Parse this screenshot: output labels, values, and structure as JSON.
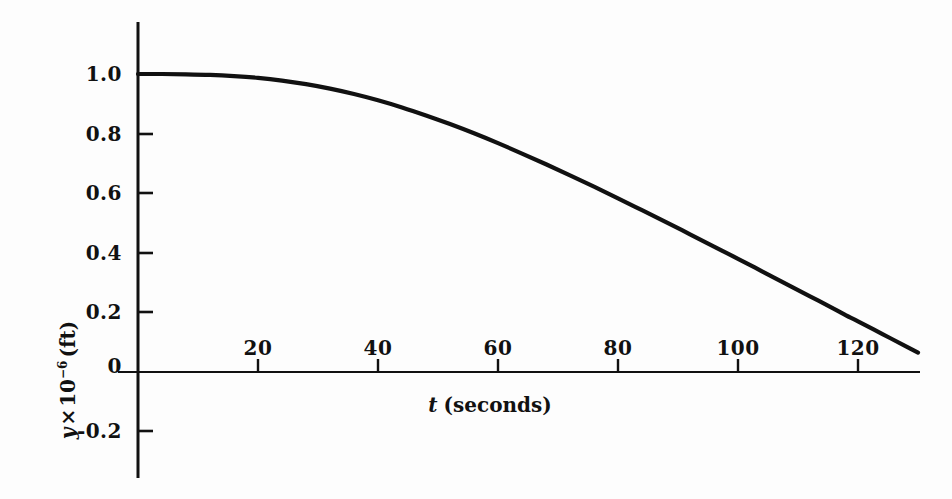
{
  "figure": {
    "background_color": "#fdfdfd",
    "ink_color": "#111111"
  },
  "chart_data": {
    "type": "line",
    "title": "",
    "subtitle": "",
    "xlabel_var": "t",
    "xlabel_unit": "(seconds)",
    "ylabel_var": "y",
    "ylabel_times": "×",
    "ylabel_base": "10",
    "ylabel_exponent": "−6",
    "ylabel_unit": "(ft)",
    "xlim": [
      0,
      132
    ],
    "ylim": [
      -0.3,
      1.12
    ],
    "grid": false,
    "legend": "none",
    "xticks": [
      20,
      40,
      60,
      80,
      100,
      120
    ],
    "xtick_labels": [
      "20",
      "40",
      "60",
      "80",
      "100",
      "120"
    ],
    "yticks": [
      1.0,
      0.8,
      0.6,
      0.4,
      0.2,
      0.0,
      -0.2
    ],
    "ytick_labels": [
      "1.0",
      "0.8",
      "0.6",
      "0.4",
      "0.2",
      "0",
      "-0.2"
    ],
    "series": [
      {
        "name": "y(t)",
        "color": "#111111",
        "x": [
          0,
          4,
          8,
          12,
          16,
          20,
          24,
          28,
          32,
          36,
          40,
          44,
          48,
          52,
          56,
          60,
          64,
          68,
          72,
          76,
          80,
          84,
          88,
          92,
          96,
          100,
          104,
          108,
          112,
          116,
          118,
          120,
          124,
          128,
          130
        ],
        "y": [
          1.0,
          1.0,
          0.999,
          0.997,
          0.993,
          0.987,
          0.978,
          0.966,
          0.951,
          0.933,
          0.912,
          0.888,
          0.861,
          0.832,
          0.801,
          0.768,
          0.733,
          0.697,
          0.66,
          0.622,
          0.583,
          0.543,
          0.503,
          0.462,
          0.421,
          0.38,
          0.338,
          0.296,
          0.254,
          0.212,
          0.19,
          0.17,
          0.128,
          0.086,
          0.065
        ]
      }
    ],
    "annotations": [],
    "notes": {
      "zero_crossing_t": 118,
      "curve_end_t": 130,
      "curve_end_y": -0.12
    }
  },
  "axes_geometry": {
    "x_axis_y_px": 372,
    "y_axis_x_px": 138,
    "x_px_per_unit": 6.0,
    "y_px_per_unit": 298.0
  }
}
